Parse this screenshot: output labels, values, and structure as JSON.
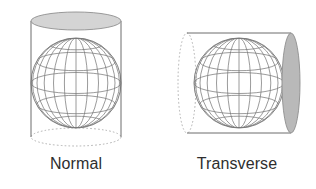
{
  "figure": {
    "title": "",
    "background_color": "#ffffff",
    "panels": [
      {
        "id": "normal",
        "caption": "Normal",
        "description": "upright cylinder enclosing a wireframe globe",
        "cylinder_orientation": "vertical",
        "cap_fill_color": "#d4d4d4",
        "cap_stroke_color": "#8e8e8e",
        "wall_stroke_color": "#6d6d6d",
        "hidden_edge_style": "dotted",
        "globe": {
          "meridian_count": 12,
          "parallel_count": 7,
          "stroke_color": "#7a7a7a",
          "axis": "vertical"
        }
      },
      {
        "id": "transverse",
        "caption": "Transverse",
        "description": "horizontal cylinder enclosing a wireframe globe",
        "cylinder_orientation": "horizontal",
        "cap_fill_color": "#b9b9b9",
        "cap_stroke_color": "#8e8e8e",
        "wall_stroke_color": "#6d6d6d",
        "hidden_edge_style": "dotted",
        "globe": {
          "meridian_count": 12,
          "parallel_count": 7,
          "stroke_color": "#7a7a7a",
          "axis": "vertical"
        }
      }
    ],
    "caption_color": "#2e2e2e"
  }
}
